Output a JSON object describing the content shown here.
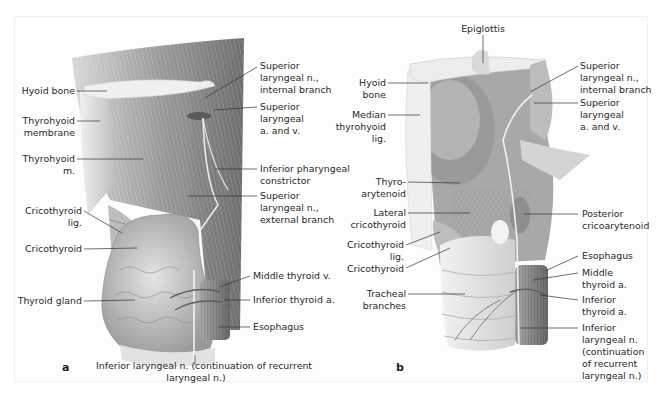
{
  "figure": {
    "panels": [
      {
        "letter": "a",
        "labels": {
          "hyoid_bone": "Hyoid bone",
          "thyrohyoid_membrane": [
            "Thyrohyoid",
            "membrane"
          ],
          "thyrohyoid_m": [
            "Thyrohyoid",
            "m."
          ],
          "cricothyroid_lig": [
            "Cricothyroid",
            "lig."
          ],
          "cricothyroid": "Cricothyroid",
          "thyroid_gland": "Thyroid gland",
          "sup_laryngeal_n_internal": [
            "Superior",
            "laryngeal n.,",
            "internal branch"
          ],
          "sup_laryngeal_a_v": [
            "Superior",
            "laryngeal",
            "a. and v."
          ],
          "inf_pharyngeal_constrictor": [
            "Inferior pharyngeal",
            "constrictor"
          ],
          "sup_laryngeal_n_external": [
            "Superior",
            "laryngeal n.,",
            "external branch"
          ],
          "middle_thyroid_v": "Middle thyroid v.",
          "inferior_thyroid_a": "Inferior thyroid a.",
          "esophagus": "Esophagus",
          "inf_laryngeal_n": [
            "Inferior laryngeal n. (continuation of recurrent",
            "laryngeal n.)"
          ]
        }
      },
      {
        "letter": "b",
        "labels": {
          "epiglottis": "Epiglottis",
          "hyoid_bone": [
            "Hyoid",
            "bone"
          ],
          "median_thyrohyoid_lig": [
            "Median",
            "thyrohyoid",
            "lig."
          ],
          "thyroarytenoid": [
            "Thyro-",
            "arytenoid"
          ],
          "lateral_cricothyroid": [
            "Lateral",
            "cricothyroid"
          ],
          "cricothyroid_lig": [
            "Cricothyroid",
            "lig."
          ],
          "cricothyroid": "Cricothyroid",
          "tracheal_branches": [
            "Tracheal",
            "branches"
          ],
          "sup_laryngeal_n_internal": [
            "Superior",
            "laryngeal n.,",
            "internal branch"
          ],
          "sup_laryngeal_a_v": [
            "Superior",
            "laryngeal",
            "a. and v."
          ],
          "posterior_cricoarytenoid": [
            "Posterior",
            "cricoarytenoid"
          ],
          "esophagus": "Esophagus",
          "middle_thyroid_a": [
            "Middle",
            "thyroid a."
          ],
          "inferior_thyroid_a": [
            "Inferior",
            "thyroid a."
          ],
          "inf_laryngeal_n": [
            "Inferior",
            "laryngeal n.",
            "(continuation",
            "of recurrent",
            "laryngeal n.)"
          ]
        }
      }
    ],
    "colors": {
      "muscle": "#a9a9a9",
      "muscle_dark": "#7d7d7d",
      "bone": "#e9e9e9",
      "gland": "#c4c4c4",
      "leader": "#333333"
    }
  }
}
